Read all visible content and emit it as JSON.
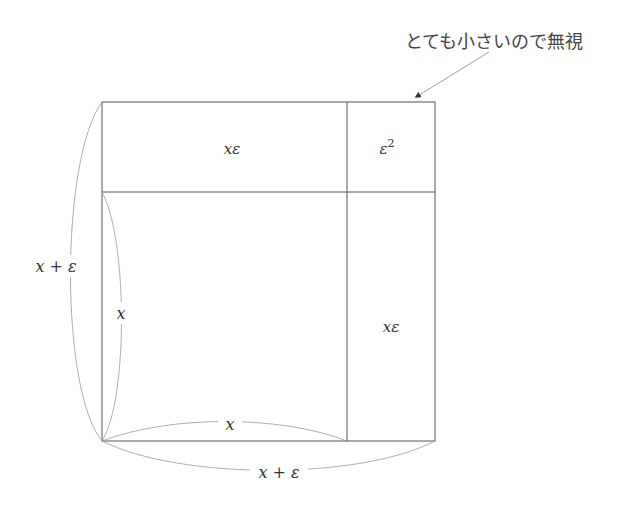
{
  "diagram": {
    "annotation": "とても小さいので無視",
    "labels": {
      "top_rect": "xε",
      "corner_base": "ε",
      "corner_exp": "2",
      "right_rect": "xε",
      "left_outer": "x + ε",
      "left_inner": "x",
      "bottom_inner": "x",
      "bottom_outer": "x + ε"
    },
    "colors": {
      "line": "#555555",
      "curve": "#888888",
      "text": "#333333"
    }
  }
}
